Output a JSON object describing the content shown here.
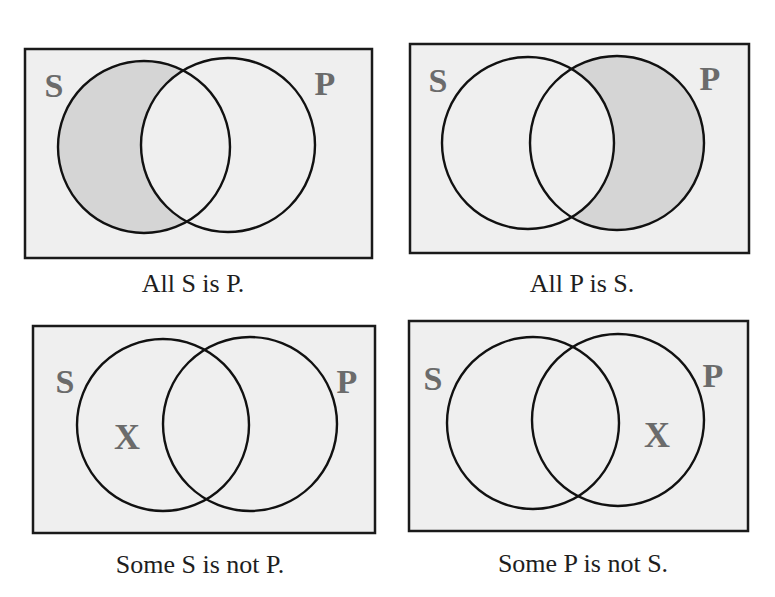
{
  "colors": {
    "background": "#ffffff",
    "box_fill": "#efefef",
    "shade_fill": "#d5d5d5",
    "outline": "#111111",
    "label_gray": "#6b6b6b",
    "caption_text": "#1e1e1e"
  },
  "panels": [
    {
      "id": "all-s-is-p",
      "caption": "All S is P.",
      "left_label": "S",
      "right_label": "P",
      "shaded_region": "S-only",
      "x_mark": null
    },
    {
      "id": "all-p-is-s",
      "caption": "All P is S.",
      "left_label": "S",
      "right_label": "P",
      "shaded_region": "P-only",
      "x_mark": null
    },
    {
      "id": "some-s-is-not-p",
      "caption": "Some S is not P.",
      "left_label": "S",
      "right_label": "P",
      "shaded_region": null,
      "x_mark": "X"
    },
    {
      "id": "some-p-is-not-s",
      "caption": "Some P is not S.",
      "left_label": "S",
      "right_label": "P",
      "shaded_region": null,
      "x_mark": "X"
    }
  ]
}
